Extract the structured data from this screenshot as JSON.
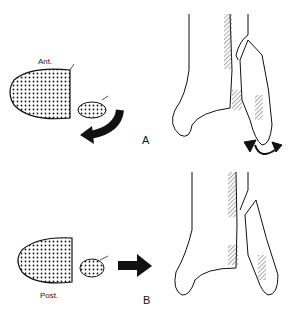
{
  "figure": {
    "panel_a": {
      "letter": "A",
      "cross_section_label": "Ant.",
      "motion": "curved arrow (rotation) and external rotation circle arrow at ankle"
    },
    "panel_b": {
      "letter": "B",
      "cross_section_label": "Post.",
      "motion": "straight arrow (lateral translation)"
    },
    "colors": {
      "line": "#111111",
      "hatch": "#555555",
      "background": "#ffffff"
    }
  }
}
